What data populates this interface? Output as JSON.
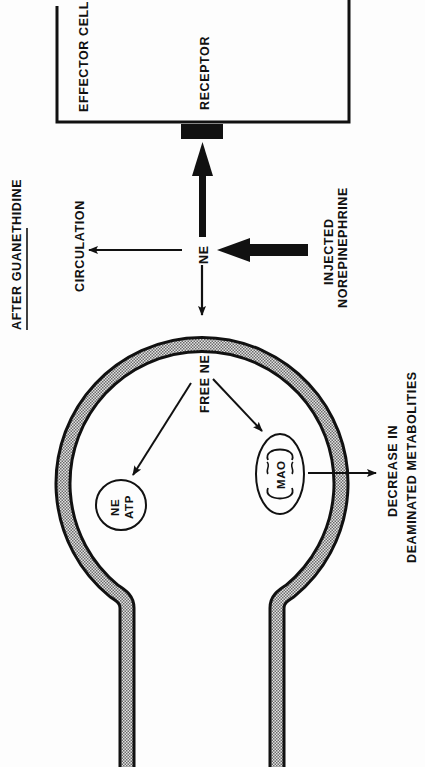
{
  "diagram": {
    "title": "AFTER GUANETHIDINE",
    "orientation": "rotated 90° counter-clockwise",
    "colors": {
      "ink": "#111111",
      "membrane_fill": "#c8c8c8",
      "background": "#fdfdfd"
    },
    "labels": {
      "effector_cell": "EFFECTOR  CELL",
      "receptor": "RECEPTOR",
      "circulation": "CIRCULATION",
      "ne": "NE",
      "injected_line1": "INJECTED",
      "injected_line2": "NOREPINEPHRINE",
      "free_ne": "FREE NE",
      "vesicle_line1": "NE",
      "vesicle_line2": "ATP",
      "mao": "MAO",
      "decrease_line1": "DECREASE  IN",
      "decrease_line2": "DEAMINATED  METABOLITIES"
    },
    "nodes": [
      {
        "id": "effector-cell",
        "label": "EFFECTOR CELL"
      },
      {
        "id": "receptor",
        "label": "RECEPTOR"
      },
      {
        "id": "ne",
        "label": "NE"
      },
      {
        "id": "injected-norepinephrine",
        "label": "INJECTED NOREPINEPHRINE"
      },
      {
        "id": "circulation",
        "label": "CIRCULATION"
      },
      {
        "id": "free-ne",
        "label": "FREE NE"
      },
      {
        "id": "storage-vesicle",
        "label": "NE ATP"
      },
      {
        "id": "mao",
        "label": "MAO"
      },
      {
        "id": "deaminated-metabolites",
        "label": "DECREASE IN DEAMINATED METABOLITIES"
      }
    ],
    "edges": [
      {
        "from": "injected-norepinephrine",
        "to": "ne",
        "style": "thick"
      },
      {
        "from": "ne",
        "to": "receptor",
        "style": "thick"
      },
      {
        "from": "ne",
        "to": "circulation",
        "style": "thin"
      },
      {
        "from": "ne",
        "to": "free-ne",
        "style": "thin"
      },
      {
        "from": "free-ne",
        "to": "storage-vesicle",
        "style": "thin"
      },
      {
        "from": "free-ne",
        "to": "mao",
        "style": "thin"
      },
      {
        "from": "mao",
        "to": "deaminated-metabolites",
        "style": "thin"
      }
    ]
  }
}
